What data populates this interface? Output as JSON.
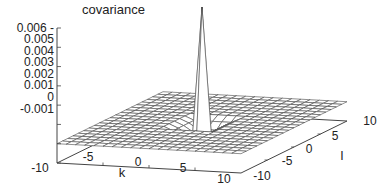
{
  "chart_data": {
    "type": "surface3d",
    "title": "",
    "zlabel": "covariance",
    "xlabel": "k",
    "ylabel": "l",
    "x_ticks": [
      "-10",
      "-5",
      "0",
      "5",
      "10"
    ],
    "y_ticks": [
      "-10",
      "-5",
      "0",
      "5",
      "10"
    ],
    "z_ticks": [
      "0.006",
      "0.005",
      "0.004",
      "0.003",
      "0.002",
      "0.001",
      "0",
      "-0.001"
    ],
    "xlim": [
      -10,
      10
    ],
    "ylim": [
      -10,
      10
    ],
    "zlim": [
      -0.001,
      0.006
    ],
    "grid": "wireframe mesh, 21x21 points, step 1",
    "peak": {
      "k": 0,
      "l": 0,
      "value": 0.006
    },
    "neighbour_values": {
      "distance_1": -0.0005,
      "distance_2": -0.0002,
      "elsewhere": 0.0
    }
  },
  "labels": {
    "zlabel": "covariance",
    "xlabel": "k",
    "ylabel": "l",
    "z_ticks": [
      "0.006 -",
      "0.005",
      "0.004",
      "0.003",
      "0.002",
      "0.001",
      "0",
      "-0.001"
    ],
    "k_ticks": [
      "-10",
      "-5",
      "0",
      "5",
      "10"
    ],
    "l_ticks": [
      "-10",
      "-5",
      "0",
      "5",
      "10"
    ]
  }
}
